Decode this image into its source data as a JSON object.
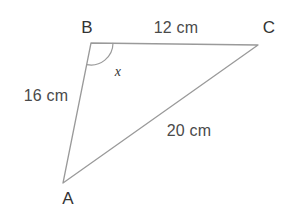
{
  "diagram": {
    "type": "triangle-geometry",
    "background_color": "#ffffff",
    "stroke_color": "#9a9a9a",
    "label_color": "#3b3b3b",
    "vertices": {
      "A": {
        "label": "A",
        "x": 63,
        "y": 183,
        "label_x": 68,
        "label_y": 198
      },
      "B": {
        "label": "B",
        "x": 91,
        "y": 43,
        "label_x": 87,
        "label_y": 27
      },
      "C": {
        "label": "C",
        "x": 258,
        "y": 45,
        "label_x": 269,
        "label_y": 27
      }
    },
    "sides": [
      {
        "name": "BC",
        "label": "12 cm",
        "from": "B",
        "to": "C",
        "label_x": 176,
        "label_y": 28
      },
      {
        "name": "AB",
        "label": "16 cm",
        "from": "A",
        "to": "B",
        "label_x": 46,
        "label_y": 96
      },
      {
        "name": "AC",
        "label": "20 cm",
        "from": "A",
        "to": "C",
        "label_x": 189,
        "label_y": 131
      }
    ],
    "angles": [
      {
        "name": "angle-B",
        "label": "x",
        "at_vertex": "B",
        "radius": 22,
        "label_x": 118,
        "label_y": 72
      }
    ]
  }
}
